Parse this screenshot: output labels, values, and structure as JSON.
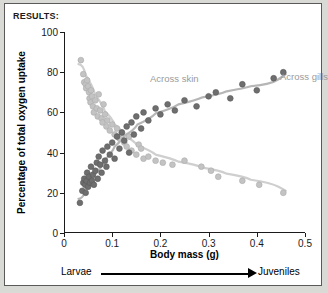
{
  "header": {
    "results_label": "RESULTS:"
  },
  "annotation": {
    "larvae": "Larvae",
    "juveniles": "Juveniles"
  },
  "colors": {
    "skin_marker": "#c3c3c3",
    "skin_line": "#cfcfcf",
    "gills_marker": "#6e6e6e",
    "gills_line": "#b6b6b6",
    "axis": "#1a1a1a",
    "label_gray": "#9a9a9a",
    "frame": "#5a5a5a",
    "page_background": "#d9d9d6"
  },
  "chart_data": {
    "type": "scatter",
    "title": "",
    "xlabel": "Body mass (g)",
    "ylabel": "Percentage of total oxygen uptake",
    "xlim": [
      0,
      0.5
    ],
    "ylim": [
      0,
      100
    ],
    "xticks": [
      0,
      0.1,
      0.2,
      0.3,
      0.4,
      0.5
    ],
    "xtick_labels": [
      "0",
      "0.1",
      "0.2",
      "0.3",
      "0.4",
      "0.5"
    ],
    "yticks": [
      0,
      20,
      40,
      60,
      80,
      100
    ],
    "ytick_labels": [
      "0",
      "20",
      "40",
      "60",
      "80",
      "100"
    ],
    "grid": false,
    "legend_position": "in-plot-annotations",
    "series": [
      {
        "name": "Across skin",
        "marker_color": "#c3c3c3",
        "line_color": "#cfcfcf",
        "trend": "decreasing",
        "points": [
          [
            0.035,
            86
          ],
          [
            0.04,
            79
          ],
          [
            0.042,
            75
          ],
          [
            0.045,
            74
          ],
          [
            0.046,
            72
          ],
          [
            0.048,
            76
          ],
          [
            0.05,
            73
          ],
          [
            0.052,
            70
          ],
          [
            0.053,
            67
          ],
          [
            0.055,
            65
          ],
          [
            0.056,
            71
          ],
          [
            0.058,
            68
          ],
          [
            0.06,
            63
          ],
          [
            0.062,
            60
          ],
          [
            0.065,
            66
          ],
          [
            0.068,
            62
          ],
          [
            0.07,
            58
          ],
          [
            0.072,
            69
          ],
          [
            0.075,
            61
          ],
          [
            0.078,
            57
          ],
          [
            0.08,
            55
          ],
          [
            0.082,
            64
          ],
          [
            0.085,
            59
          ],
          [
            0.088,
            53
          ],
          [
            0.09,
            56
          ],
          [
            0.095,
            51
          ],
          [
            0.1,
            54
          ],
          [
            0.105,
            49
          ],
          [
            0.11,
            52
          ],
          [
            0.115,
            47
          ],
          [
            0.12,
            50
          ],
          [
            0.125,
            45
          ],
          [
            0.13,
            43
          ],
          [
            0.135,
            48
          ],
          [
            0.14,
            41
          ],
          [
            0.15,
            39
          ],
          [
            0.155,
            44
          ],
          [
            0.16,
            42
          ],
          [
            0.165,
            37
          ],
          [
            0.175,
            38
          ],
          [
            0.19,
            36
          ],
          [
            0.205,
            35
          ],
          [
            0.225,
            34
          ],
          [
            0.25,
            36
          ],
          [
            0.285,
            33
          ],
          [
            0.305,
            31
          ],
          [
            0.32,
            28
          ],
          [
            0.37,
            26
          ],
          [
            0.405,
            24
          ],
          [
            0.455,
            20
          ]
        ],
        "curve": [
          [
            0.03,
            84
          ],
          [
            0.05,
            73
          ],
          [
            0.07,
            64
          ],
          [
            0.09,
            57
          ],
          [
            0.11,
            51
          ],
          [
            0.13,
            46
          ],
          [
            0.16,
            41
          ],
          [
            0.2,
            37
          ],
          [
            0.25,
            34
          ],
          [
            0.3,
            31
          ],
          [
            0.35,
            28
          ],
          [
            0.4,
            25
          ],
          [
            0.46,
            21
          ]
        ]
      },
      {
        "name": "Across gills",
        "marker_color": "#6e6e6e",
        "line_color": "#b6b6b6",
        "trend": "increasing",
        "points": [
          [
            0.033,
            15
          ],
          [
            0.038,
            21
          ],
          [
            0.04,
            25
          ],
          [
            0.042,
            27
          ],
          [
            0.044,
            24
          ],
          [
            0.045,
            20
          ],
          [
            0.047,
            26
          ],
          [
            0.048,
            30
          ],
          [
            0.05,
            23
          ],
          [
            0.052,
            28
          ],
          [
            0.054,
            25
          ],
          [
            0.056,
            33
          ],
          [
            0.058,
            26
          ],
          [
            0.06,
            29
          ],
          [
            0.062,
            24
          ],
          [
            0.065,
            31
          ],
          [
            0.068,
            35
          ],
          [
            0.07,
            27
          ],
          [
            0.072,
            38
          ],
          [
            0.075,
            34
          ],
          [
            0.078,
            30
          ],
          [
            0.08,
            41
          ],
          [
            0.085,
            36
          ],
          [
            0.088,
            33
          ],
          [
            0.09,
            43
          ],
          [
            0.095,
            39
          ],
          [
            0.1,
            45
          ],
          [
            0.105,
            37
          ],
          [
            0.11,
            48
          ],
          [
            0.115,
            42
          ],
          [
            0.12,
            50
          ],
          [
            0.125,
            46
          ],
          [
            0.13,
            53
          ],
          [
            0.135,
            40
          ],
          [
            0.14,
            55
          ],
          [
            0.145,
            49
          ],
          [
            0.15,
            58
          ],
          [
            0.16,
            52
          ],
          [
            0.165,
            60
          ],
          [
            0.175,
            56
          ],
          [
            0.19,
            62
          ],
          [
            0.2,
            59
          ],
          [
            0.215,
            64
          ],
          [
            0.23,
            61
          ],
          [
            0.25,
            66
          ],
          [
            0.275,
            63
          ],
          [
            0.3,
            68
          ],
          [
            0.315,
            70
          ],
          [
            0.345,
            67
          ],
          [
            0.37,
            74
          ],
          [
            0.4,
            71
          ],
          [
            0.435,
            77
          ],
          [
            0.455,
            80
          ]
        ],
        "curve": [
          [
            0.03,
            17
          ],
          [
            0.05,
            26
          ],
          [
            0.07,
            33
          ],
          [
            0.09,
            40
          ],
          [
            0.11,
            46
          ],
          [
            0.13,
            51
          ],
          [
            0.16,
            57
          ],
          [
            0.2,
            62
          ],
          [
            0.25,
            66
          ],
          [
            0.3,
            69
          ],
          [
            0.35,
            72
          ],
          [
            0.4,
            74
          ],
          [
            0.46,
            79
          ]
        ]
      }
    ]
  }
}
